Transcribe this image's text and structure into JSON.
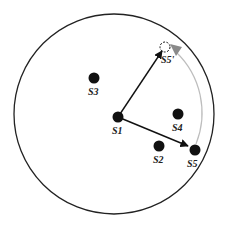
{
  "colors": {
    "background": "#ffffff",
    "ink": "#111111",
    "arc": "#bdbdbd",
    "arc_head": "#8a8a8a"
  },
  "boundary": {
    "cx": 114,
    "cy": 114,
    "r": 100
  },
  "nodes": [
    {
      "id": "S1",
      "label": "S1",
      "x": 118,
      "y": 117,
      "lx": 112,
      "ly": 134
    },
    {
      "id": "S2",
      "label": "S2",
      "x": 159,
      "y": 146,
      "lx": 153,
      "ly": 163
    },
    {
      "id": "S3",
      "label": "S3",
      "x": 94,
      "y": 78,
      "lx": 88,
      "ly": 95
    },
    {
      "id": "S4",
      "label": "S4",
      "x": 178,
      "y": 114,
      "lx": 172,
      "ly": 131
    },
    {
      "id": "S5",
      "label": "S5",
      "x": 195,
      "y": 150,
      "lx": 187,
      "ly": 167
    }
  ],
  "ghost_node": {
    "id": "S5'",
    "label": "S5'",
    "x": 165,
    "y": 47,
    "lx": 161,
    "ly": 63
  },
  "arrows": [
    {
      "from": "S1",
      "to": "S5'",
      "x1": 118,
      "y1": 117,
      "x2": 162,
      "y2": 51
    },
    {
      "from": "S1",
      "to": "S5",
      "x1": 118,
      "y1": 117,
      "x2": 188,
      "y2": 146
    }
  ],
  "rotation_arc": {
    "from": "S5",
    "to": "S5'",
    "path": "M 196 144 A 84 84 0 0 0 176 52"
  }
}
